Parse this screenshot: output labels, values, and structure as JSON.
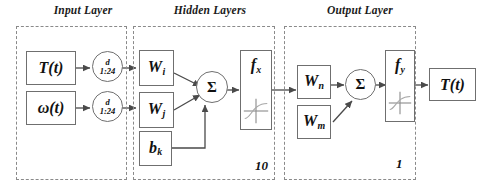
{
  "diagram": {
    "width": 483,
    "height": 192,
    "background_color": "#ffffff",
    "line_color": "#6f6f6f",
    "dashed_color": "#8a8a8a",
    "text_color": "#111111"
  },
  "layers": {
    "input": {
      "caption": "Input Layer",
      "nodes": [
        {
          "label": "T(t)",
          "type": "input-signal"
        },
        {
          "label": "ω(t)",
          "type": "input-signal"
        }
      ],
      "delays": [
        {
          "top": "d",
          "bottom": "1:24"
        },
        {
          "top": "d",
          "bottom": "1:24"
        }
      ]
    },
    "hidden": {
      "caption": "Hidden Layers",
      "neuron_count": "10",
      "weights": [
        {
          "base": "W",
          "sub": "i"
        },
        {
          "base": "W",
          "sub": "j"
        }
      ],
      "bias": {
        "base": "b",
        "sub": "k"
      },
      "sum_symbol": "Σ",
      "activation": {
        "base": "f",
        "sub": "x"
      }
    },
    "output": {
      "caption": "Output Layer",
      "neuron_count": "1",
      "weights": [
        {
          "base": "W",
          "sub": "n"
        },
        {
          "base": "W",
          "sub": "m"
        }
      ],
      "sum_symbol": "Σ",
      "activation": {
        "base": "f",
        "sub": "y"
      },
      "result": {
        "label": "T(t)",
        "type": "output-signal"
      }
    }
  }
}
